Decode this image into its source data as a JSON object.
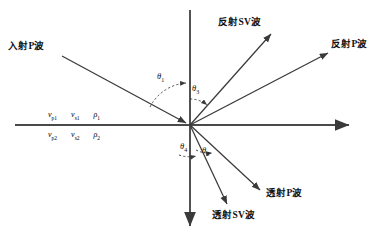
{
  "figure": {
    "type": "physics-ray-diagram",
    "background_color": "#ffffff",
    "line_color": "#3a3a3a",
    "text_color": "#111111"
  },
  "axes": {
    "vertical": {
      "name": "normal-axis",
      "x": 190,
      "y_top": 10,
      "y_bottom": 228,
      "arrow": "down"
    },
    "horizontal": {
      "name": "interface-axis",
      "y": 125,
      "x_left": 15,
      "x_right": 352,
      "arrow": "right"
    },
    "origin": {
      "x": 190,
      "y": 125
    }
  },
  "rays": [
    {
      "id": "incident-p",
      "label": "入射P波",
      "x1": 62,
      "y1": 56,
      "x2": 188,
      "y2": 124,
      "arrow_at": "end"
    },
    {
      "id": "reflected-sv",
      "label": "反射SV波",
      "x1": 190,
      "y1": 125,
      "x2": 272,
      "y2": 33,
      "arrow_at": "end"
    },
    {
      "id": "reflected-p",
      "label": "反射P波",
      "x1": 190,
      "y1": 125,
      "x2": 330,
      "y2": 52,
      "arrow_at": "end"
    },
    {
      "id": "transmitted-p",
      "label": "透射P波",
      "x1": 190,
      "y1": 125,
      "x2": 262,
      "y2": 192,
      "arrow_at": "end"
    },
    {
      "id": "transmitted-sv",
      "label": "透射SV波",
      "x1": 190,
      "y1": 125,
      "x2": 228,
      "y2": 206,
      "arrow_at": "end"
    }
  ],
  "ray_labels": {
    "incident_p": "入射P波",
    "reflected_sv": "反射SV波",
    "reflected_p": "反射P波",
    "transmitted_p": "透射P波",
    "transmitted_sv": "透射SV波"
  },
  "angles": [
    {
      "id": "theta-1",
      "symbol": "θ",
      "subscript": "1",
      "region": "upper-left",
      "meaning": "incidence angle"
    },
    {
      "id": "theta-3",
      "symbol": "θ",
      "subscript": "3",
      "region": "upper-right",
      "meaning": "reflected SV angle"
    },
    {
      "id": "theta-4",
      "symbol": "θ",
      "subscript": "4",
      "region": "lower-left",
      "meaning": "transmitted SV angle"
    },
    {
      "id": "theta-2",
      "symbol": "θ",
      "subscript": "2",
      "region": "lower-right",
      "meaning": "transmitted P angle"
    }
  ],
  "media": {
    "upper": {
      "name": "medium-1",
      "params": [
        {
          "symbol": "v",
          "subscript": "p1"
        },
        {
          "symbol": "v",
          "subscript": "s1"
        },
        {
          "symbol": "ρ",
          "subscript": "1"
        }
      ]
    },
    "lower": {
      "name": "medium-2",
      "params": [
        {
          "symbol": "v",
          "subscript": "p2"
        },
        {
          "symbol": "v",
          "subscript": "s2"
        },
        {
          "symbol": "ρ",
          "subscript": "2"
        }
      ]
    }
  }
}
